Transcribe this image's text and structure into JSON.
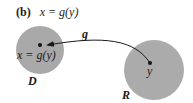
{
  "figure": {
    "panel_label": "(b)",
    "title_equation": "x = g(y)",
    "map_label": "g",
    "domain_set": {
      "label": "D",
      "point_label": "x = g(y)",
      "fill": "#a9a9a9"
    },
    "range_set": {
      "label": "R",
      "point_label": "y",
      "fill": "#ababab"
    },
    "arrow_color": "#1a1a1a",
    "dot_color": "#111111"
  }
}
